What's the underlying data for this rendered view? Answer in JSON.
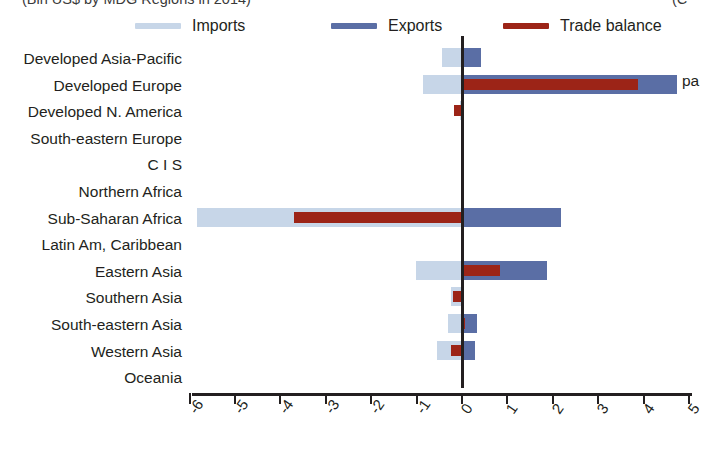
{
  "title": {
    "left_clipped": "(Bln US$ by MDG Regions in 2014)",
    "right_clipped": "(C"
  },
  "side_note": "pa",
  "legend": {
    "items": [
      {
        "label": "Imports",
        "color": "#c7d6e8",
        "name": "legend-imports"
      },
      {
        "label": "Exports",
        "color": "#5a6ea5",
        "name": "legend-exports"
      },
      {
        "label": "Trade balance",
        "color": "#9c2417",
        "name": "legend-trade-balance"
      }
    ]
  },
  "chart_data": {
    "type": "bar",
    "orientation": "horizontal",
    "title": "(Bln US$ by MDG Regions in 2014)",
    "xlabel": "",
    "ylabel": "",
    "xlim": [
      -6,
      5
    ],
    "xticks": [
      "-6",
      "-5",
      "-4",
      "-3",
      "-2",
      "-1",
      "0",
      "1",
      "2",
      "3",
      "4",
      "5"
    ],
    "grid": false,
    "legend_position": "top",
    "categories": [
      "Developed Asia-Pacific",
      "Developed Europe",
      "Developed N. America",
      "South-eastern Europe",
      "C I S",
      "Northern Africa",
      "Sub-Saharan Africa",
      "Latin Am, Caribbean",
      "Eastern Asia",
      "Southern Asia",
      "South-eastern Asia",
      "Western Asia",
      "Oceania"
    ],
    "series": [
      {
        "name": "Imports",
        "color": "#c7d6e8",
        "values": [
          -0.42,
          -0.83,
          -0.02,
          0.0,
          0.0,
          0.0,
          -5.82,
          0.0,
          -1.0,
          -0.22,
          -0.28,
          -0.52,
          0.0
        ]
      },
      {
        "name": "Exports",
        "color": "#5a6ea5",
        "values": [
          0.44,
          4.75,
          0.0,
          0.0,
          0.0,
          0.0,
          2.2,
          0.0,
          1.9,
          0.0,
          0.36,
          0.3,
          0.0
        ]
      },
      {
        "name": "Trade balance",
        "color": "#9c2417",
        "values": [
          0.05,
          3.9,
          -0.15,
          0.0,
          0.0,
          0.0,
          -3.68,
          0.0,
          0.87,
          -0.18,
          0.08,
          -0.22,
          0.0
        ]
      }
    ]
  }
}
